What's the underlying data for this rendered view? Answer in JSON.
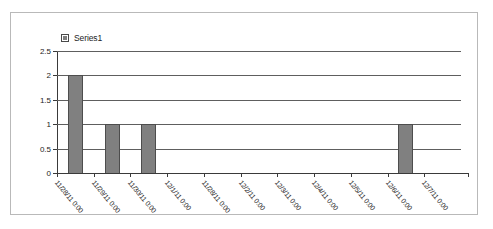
{
  "chart_data": {
    "type": "bar",
    "title": "",
    "subtitle": "",
    "xlabel": "",
    "ylabel": "",
    "ylim": [
      0,
      2.5
    ],
    "ytick_labels": [
      "0",
      "0.5",
      "1",
      "1.5",
      "2",
      "2.5"
    ],
    "ytick_values": [
      0,
      0.5,
      1,
      1.5,
      2,
      2.5
    ],
    "grid": true,
    "legend_position": "top-left",
    "legend": [
      "Series1"
    ],
    "categories": [
      "11/28/11 0:00",
      "11/29/11 0:00",
      "11/30/11 0:00",
      "12/1/11 0:00",
      "11/28/11 0:00",
      "12/2/11 0:00",
      "12/3/11 0:00",
      "12/4/11 0:00",
      "12/5/11 0:00",
      "12/6/11 0:00",
      "12/7/11 0:00"
    ],
    "series": [
      {
        "name": "Series1",
        "color": "#808080",
        "values": [
          2,
          1,
          1,
          0,
          0,
          0,
          0,
          0,
          0,
          1,
          0
        ]
      }
    ]
  },
  "legend": {
    "series1_label": "Series1",
    "marker_color": "#808080"
  },
  "axes": {
    "y": {
      "ticks": [
        {
          "label": "2.5",
          "value": 2.5
        },
        {
          "label": "2",
          "value": 2
        },
        {
          "label": "1.5",
          "value": 1.5
        },
        {
          "label": "1",
          "value": 1
        },
        {
          "label": "0.5",
          "value": 0.5
        },
        {
          "label": "0",
          "value": 0
        }
      ]
    },
    "x": {
      "ticks": [
        {
          "label": "11/28/11 0:00"
        },
        {
          "label": "11/29/11 0:00"
        },
        {
          "label": "11/30/11 0:00"
        },
        {
          "label": "12/1/11 0:00"
        },
        {
          "label": "11/28/11 0:00"
        },
        {
          "label": "12/2/11 0:00"
        },
        {
          "label": "12/3/11 0:00"
        },
        {
          "label": "12/4/11 0:00"
        },
        {
          "label": "12/5/11 0:00"
        },
        {
          "label": "12/6/11 0:00"
        },
        {
          "label": "12/7/11 0:00"
        }
      ]
    }
  }
}
